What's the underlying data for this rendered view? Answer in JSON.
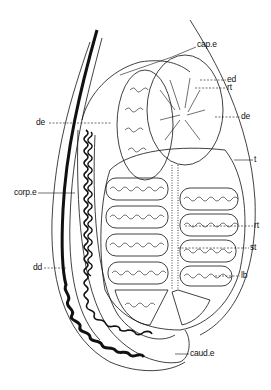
{
  "figure": {
    "type": "anatomical-line-drawing",
    "colors": {
      "ink": "#111111",
      "background": "#ffffff"
    }
  },
  "labels": [
    {
      "id": "cap_e",
      "text": "cap.e",
      "x": 197,
      "y": 44
    },
    {
      "id": "ed",
      "text": "ed",
      "x": 227,
      "y": 77
    },
    {
      "id": "rt_top",
      "text": "rt",
      "x": 227,
      "y": 85
    },
    {
      "id": "de_r",
      "text": "de",
      "x": 241,
      "y": 114
    },
    {
      "id": "de_l",
      "text": "de",
      "x": 37,
      "y": 120
    },
    {
      "id": "t",
      "text": "t",
      "x": 254,
      "y": 156
    },
    {
      "id": "corp_e",
      "text": "corp.e",
      "x": 14,
      "y": 190
    },
    {
      "id": "rt_mid",
      "text": "rt",
      "x": 254,
      "y": 223
    },
    {
      "id": "st",
      "text": "st",
      "x": 250,
      "y": 245
    },
    {
      "id": "lb",
      "text": "lb",
      "x": 241,
      "y": 273
    },
    {
      "id": "dd",
      "text": "dd",
      "x": 33,
      "y": 265
    },
    {
      "id": "caud_e",
      "text": "caud.e",
      "x": 190,
      "y": 351
    }
  ]
}
